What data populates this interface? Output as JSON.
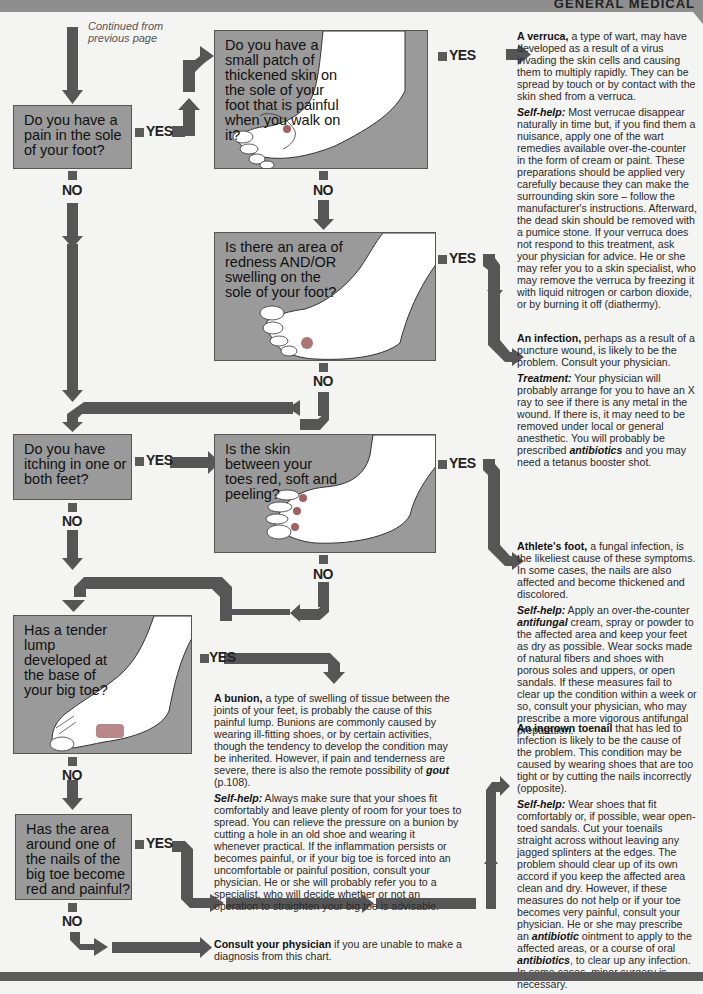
{
  "header": {
    "section_title": "GENERAL MEDICAL"
  },
  "continued_note": [
    "Continued from",
    "previous page"
  ],
  "labels": {
    "yes": "YES",
    "no": "NO"
  },
  "questions": [
    {
      "id": "q1",
      "text": "Do you have a pain in the sole of your foot?"
    },
    {
      "id": "q2",
      "text": "Do you have a small patch of thickened skin on the sole of your foot that is painful when you walk on it?"
    },
    {
      "id": "q3",
      "text": "Is there an area of redness AND/OR swelling on the sole of your foot?"
    },
    {
      "id": "q4",
      "text": "Do you have itching in one or both feet?"
    },
    {
      "id": "q5",
      "text": "Is the skin between your toes red, soft and peeling?"
    },
    {
      "id": "q6",
      "text": "Has a tender lump developed at the base of your big toe?"
    },
    {
      "id": "q7",
      "text": "Has the area around one of the nails of the big toe become red and painful?"
    }
  ],
  "outcomes": {
    "verruca": {
      "head": "A verruca,",
      "body": " a type of wart, may have developed as a result of a virus invading the skin cells and causing them to multiply rapidly. They can be spread by touch or by contact with the skin shed from a verruca.",
      "sub_head": "Self-help:",
      "sub_body": " Most verrucae disappear naturally in time but, if you find them a nuisance, apply one of the wart remedies available over-the-counter in the form of cream or paint. These preparations should be applied very carefully because they can make the surrounding skin sore – follow the manufacturer's instructions. Afterward, the dead skin should be removed with a pumice stone. If your verruca does not respond to this treatment, ask your physician for advice. He or she may refer you to a skin specialist, who may remove the verruca by freezing it with liquid nitrogen or carbon dioxide, or by burning it off (diathermy)."
    },
    "infection": {
      "head": "An infection,",
      "body": " perhaps as a result of a puncture wound, is likely to be the problem. Consult your physician.",
      "sub_head": "Treatment:",
      "sub_body_1": " Your physician will probably arrange for you to have an X ray to see if there is any metal in the wound. If there is, it may need to be removed under local or general anesthetic. You will probably be prescribed ",
      "sub_em": "antibiotics",
      "sub_body_2": " and you may need a tetanus booster shot."
    },
    "athletes_foot": {
      "head": "Athlete's foot,",
      "body": " a fungal infection, is the likeliest cause of these symptoms. In some cases, the nails are also affected and become thickened and discolored.",
      "sub_head": "Self-help:",
      "sub_body_1": " Apply an over-the-counter ",
      "sub_em": "antifungal",
      "sub_body_2": " cream, spray or powder to the affected area and keep your feet as dry as possible. Wear socks made of natural fibers and shoes with porous soles and uppers, or open sandals. If these measures fail to clear up the condition within a week or so, consult your physician, who may prescribe a more vigorous antifungal preparation."
    },
    "bunion": {
      "head": "A bunion,",
      "body_1": " a type of swelling of tissue between the joints of your feet, is probably the cause of this painful lump. Bunions are commonly caused by wearing ill-fitting shoes, or by certain activities, though the tendency to develop the condition may be inherited. However, if pain and tenderness are severe, there is also the remote possibility of ",
      "body_em": "gout",
      "body_2": " (p.108).",
      "sub_head": "Self-help:",
      "sub_body": " Always make sure that your shoes fit comfortably and leave plenty of room for your toes to spread. You can relieve the pressure on a bunion by cutting a hole in an old shoe and wearing it whenever practical. If the inflammation persists or becomes painful, or if your big toe is forced into an uncomfortable or painful position, consult your physician. He or she will probably refer you to a specialist, who will decide whether or not an operation to straighten your big toe is advisable."
    },
    "ingrown_toenail": {
      "head": "An ingrown toenail",
      "body": " that has led to infection is likely to be the cause of the problem. This condition may be caused by wearing shoes that are too tight or by cutting the nails incorrectly (opposite).",
      "sub_head": "Self-help:",
      "sub_body_1": " Wear shoes that fit comfortably or, if possible, wear open-toed sandals. Cut your toenails straight across without leaving any jagged splinters at the edges. The problem should clear up of its own accord if you keep the affected area clean and dry. However, if these measures do not help or if your toe becomes very painful, consult your physician. He or she may prescribe an ",
      "sub_em_1": "antibiotic",
      "sub_body_2": " ointment to apply to the affected areas, or a course of oral ",
      "sub_em_2": "antibiotics",
      "sub_body_3": ", to clear up any infection. In some cases, minor surgery is necessary."
    },
    "consult": {
      "head": "Consult your physician",
      "body": " if you are unable to make a diagnosis from this chart."
    }
  },
  "colors": {
    "box_fill": "#9a9a9a",
    "arrow": "#555555",
    "page_bg": "#f4f4f2",
    "highlight": "#8a3a3a"
  }
}
